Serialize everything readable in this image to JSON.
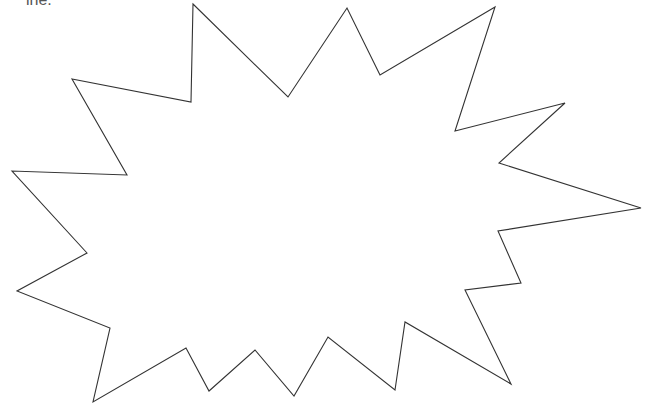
{
  "header": {
    "cut_text": "ine."
  },
  "shape": {
    "type": "starburst",
    "stroke": "#333333",
    "fill": "#ffffff",
    "points": "193,4 288,97 347,8 380,75 495,7 455,131 565,103 499,163 641,208 498,231 521,283 465,290 511,384 405,322 395,390 328,337 294,396 255,350 209,391 186,348 93,402 110,328 17,291 87,253 12,171 127,175 72,79 191,102"
  }
}
